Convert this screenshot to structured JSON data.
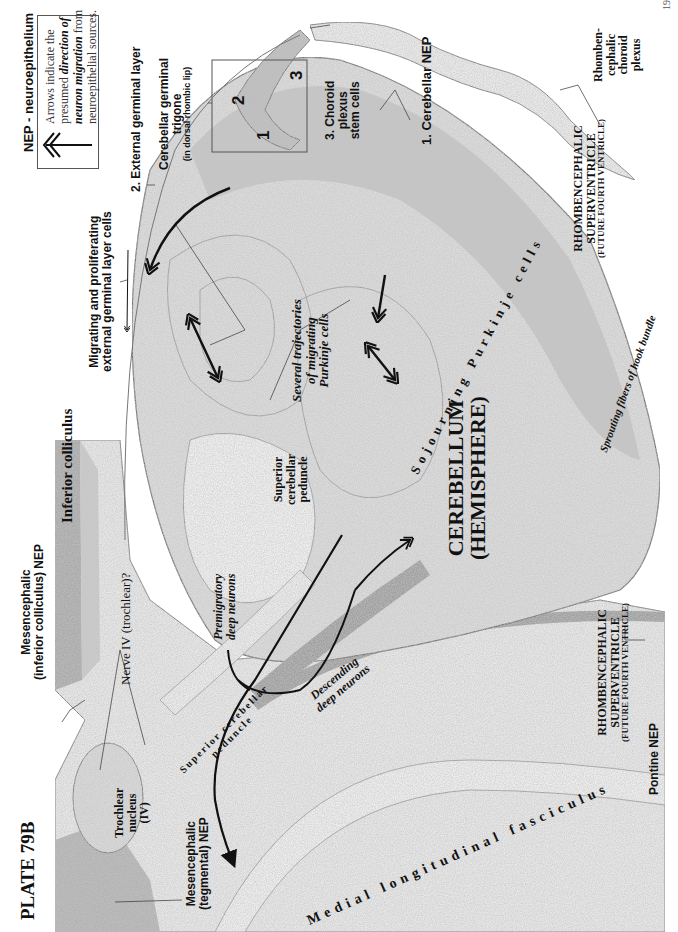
{
  "plate": {
    "title": "PLATE 79B",
    "page_number": "19"
  },
  "legend": {
    "nep_definition": "NEP - neuroepithelium",
    "arrow_note_line1": "Arrows indicate the",
    "arrow_note_line2_pre": "presumed ",
    "arrow_note_line2_em": "direction of",
    "arrow_note_line3_em": "neuron migration",
    "arrow_note_line3_post": " from",
    "arrow_note_line4": "neuroepithelial sources."
  },
  "labels": {
    "external_germinal_layer": "2. External germinal layer",
    "germinal_trigone_line1": "Cerebellar germinal",
    "germinal_trigone_line2": "trigone",
    "germinal_trigone_line3": "(in dorsal rhombic lip)",
    "choroid_stem_line1": "3. Choroid",
    "choroid_stem_line2": "plexus",
    "choroid_stem_line3": "stem cells",
    "cerebellar_nep": "1. Cerebellar NEP",
    "rhombencephalic_choroid_line1": "Rhomben-",
    "rhombencephalic_choroid_line2": "cephalic",
    "rhombencephalic_choroid_line3": "choroid",
    "rhombencephalic_choroid_line4": "plexus",
    "migrating_egl_line1": "Migrating and proliferating",
    "migrating_egl_line2": "external germinal layer cells",
    "sojourning_purkinje": "Sojourning Purkinje cells",
    "several_trajectories_line1": "Several trajectories",
    "several_trajectories_line2": "of migrating",
    "several_trajectories_line3": "Purkinje cells",
    "sprouting_fibers": "Sprouting fibers of hook bundle",
    "supervent_top_line1": "RHOMBENCEPHALIC",
    "supervent_top_line2": "SUPERVENTRICLE",
    "supervent_top_line3": "(FUTURE FOURTH VENTRICLE)",
    "inferior_colliculus": "Inferior colliculus",
    "superior_cerebellar_peduncle_line1": "Superior",
    "superior_cerebellar_peduncle_line2": "cerebellar",
    "superior_cerebellar_peduncle_line3": "peduncle",
    "cerebellum_line1": "CEREBELLUM",
    "cerebellum_line2": "(HEMISPHERE)",
    "mes_ic_nep_line1": "Mesencephalic",
    "mes_ic_nep_line2": "(inferior colliculus) NEP",
    "nerve_iv": "Nerve IV (trochlear)?",
    "premigratory_line1": "Premigratory",
    "premigratory_line2": "deep neurons",
    "descending_line1": "Descending",
    "descending_line2": "deep neurons",
    "scp_curved_line1": "Superior cerebellar",
    "scp_curved_line2": "peduncle",
    "supervent_bottom_line1": "RHOMBENCEPHALIC",
    "supervent_bottom_line2": "SUPERVENTRICLE",
    "supervent_bottom_line3": "(FUTURE FOURTH VENTRICLE)",
    "trochlear_line1": "Trochlear",
    "trochlear_line2": "nucleus",
    "trochlear_line3": "(IV)",
    "mes_teg_nep_line1": "Mesencephalic",
    "mes_teg_nep_line2": "(tegmental) NEP",
    "pontine_nep": "Pontine NEP",
    "mlf": "Medial longitudinal fasciculus"
  },
  "inset": {
    "markers": [
      "1",
      "2",
      "3"
    ]
  },
  "colors": {
    "tissue_light": "#e6e6e6",
    "tissue_mid": "#cfcfcf",
    "tissue_dark": "#a8a8a8",
    "outline": "#6e6e6e",
    "arrow": "#111111"
  }
}
